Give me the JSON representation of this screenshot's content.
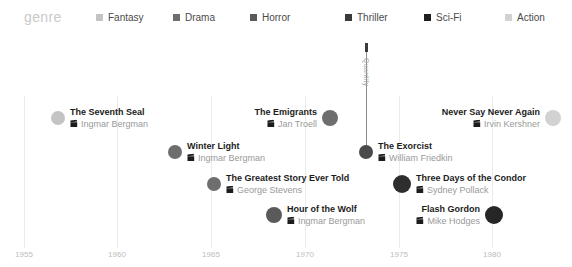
{
  "legend": {
    "title": "genre",
    "items": [
      {
        "label": "Fantasy",
        "color": "#c4c4c4",
        "x": 96
      },
      {
        "label": "Drama",
        "color": "#6e6e6e",
        "x": 173
      },
      {
        "label": "Horror",
        "color": "#5a5a5a",
        "x": 250
      },
      {
        "label": "Thriller",
        "color": "#3a3a3a",
        "x": 345
      },
      {
        "label": "Sci-Fi",
        "color": "#1f1f1f",
        "x": 424
      },
      {
        "label": "Action",
        "color": "#d2d2d2",
        "x": 505
      }
    ]
  },
  "axis": {
    "y_label": "Quantity",
    "ticks": [
      {
        "label": "1955",
        "x": 24
      },
      {
        "label": "1960",
        "x": 117
      },
      {
        "label": "1965",
        "x": 211
      },
      {
        "label": "1970",
        "x": 305
      },
      {
        "label": "1975",
        "x": 399
      },
      {
        "label": "1980",
        "x": 492
      }
    ]
  },
  "chart_data": {
    "type": "scatter",
    "title": "genre",
    "xlabel": "",
    "ylabel": "Quantity",
    "xlim": [
      1955,
      1982
    ],
    "legend_position": "top",
    "grid": true,
    "categories": [
      "Fantasy",
      "Drama",
      "Horror",
      "Thriller",
      "Sci-Fi",
      "Action"
    ],
    "points": [
      {
        "title": "The Seventh Seal",
        "director": "Ingmar Bergman",
        "year": 1957,
        "genre": "Fantasy",
        "color": "#c4c4c4",
        "radius": 7,
        "px": 58,
        "py": 84,
        "align": "left",
        "label_offset": 12
      },
      {
        "title": "Winter Light",
        "director": "Ingmar Bergman",
        "year": 1963,
        "genre": "Drama",
        "color": "#6e6e6e",
        "radius": 7,
        "py": 118,
        "px": 175,
        "align": "left",
        "label_offset": 12
      },
      {
        "title": "The Greatest Story Ever Told",
        "director": "George Stevens",
        "year": 1965,
        "genre": "Drama",
        "color": "#6e6e6e",
        "radius": 7,
        "px": 214,
        "py": 150,
        "align": "left",
        "label_offset": 12
      },
      {
        "title": "Hour of the Wolf",
        "director": "Ingmar Bergman",
        "year": 1968,
        "genre": "Horror",
        "color": "#5a5a5a",
        "radius": 8,
        "px": 274,
        "py": 181,
        "align": "left",
        "label_offset": 13
      },
      {
        "title": "The Emigrants",
        "director": "Jan Troell",
        "year": 1971,
        "genre": "Drama",
        "color": "#6e6e6e",
        "radius": 8,
        "px": 330,
        "py": 84,
        "align": "right",
        "label_offset": 13
      },
      {
        "title": "The Exorcist",
        "director": "William Friedkin",
        "year": 1973,
        "genre": "Thriller",
        "color": "#4a4a4a",
        "radius": 7,
        "px": 366,
        "py": 118,
        "align": "left",
        "label_offset": 12
      },
      {
        "title": "Three Days of the Condor",
        "director": "Sydney Pollack",
        "year": 1975,
        "genre": "Thriller",
        "color": "#2e2e2e",
        "radius": 9,
        "px": 402,
        "py": 150,
        "align": "left",
        "label_offset": 14
      },
      {
        "title": "Flash Gordon",
        "director": "Mike Hodges",
        "year": 1980,
        "genre": "Sci-Fi",
        "color": "#262626",
        "radius": 9,
        "px": 494,
        "py": 181,
        "align": "right",
        "label_offset": 14
      },
      {
        "title": "Never Say Never Again",
        "director": "Irvin Kershner",
        "year": 1983,
        "genre": "Action",
        "color": "#d2d2d2",
        "radius": 8,
        "px": 553,
        "py": 84,
        "align": "right",
        "label_offset": 13
      }
    ]
  }
}
